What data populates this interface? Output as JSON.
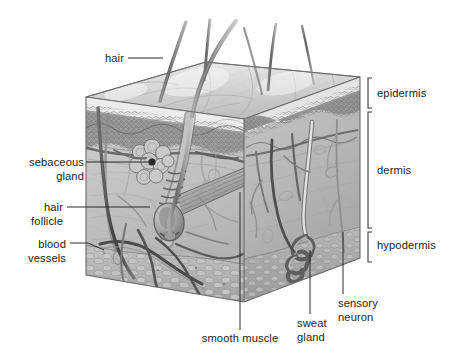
{
  "figure": {
    "kind": "anatomical-diagram",
    "style": "grayscale pencil/airbrush medical illustration",
    "background_color": "#ffffff",
    "ink_color": "#1e1e1e"
  },
  "labels": {
    "hair": "hair",
    "sebaceous_gland": "sebaceous\ngland",
    "hair_follicle": "hair\nfollicle",
    "blood_vessels": "blood\nvessels",
    "smooth_muscle": "smooth muscle",
    "sweat_gland": "sweat\ngland",
    "sensory_neuron": "sensory\nneuron",
    "epidermis": "epidermis",
    "dermis": "dermis",
    "hypodermis": "hypodermis"
  },
  "layers": [
    {
      "name": "epidermis",
      "label": "epidermis",
      "bracket_top": 78,
      "bracket_bottom": 108,
      "text_y": 88
    },
    {
      "name": "dermis",
      "label": "dermis",
      "bracket_top": 110,
      "bracket_bottom": 228,
      "text_y": 165
    },
    {
      "name": "hypodermis",
      "label": "hypodermis",
      "bracket_top": 230,
      "bracket_bottom": 262,
      "text_y": 240
    }
  ],
  "structures": [
    {
      "name": "hair",
      "label": "hair",
      "leader_from": [
        128,
        58
      ],
      "leader_to": [
        163,
        58
      ]
    },
    {
      "name": "sebaceous-gland",
      "label": "sebaceous gland",
      "leader_from": [
        86,
        162
      ],
      "leader_to": [
        152,
        162
      ]
    },
    {
      "name": "hair-follicle",
      "label": "hair follicle",
      "leader_from": [
        67,
        207
      ],
      "leader_to": [
        150,
        207
      ]
    },
    {
      "name": "blood-vessels",
      "label": "blood vessels",
      "leader_from": [
        70,
        243
      ],
      "leader_to": [
        100,
        248
      ]
    },
    {
      "name": "smooth-muscle",
      "label": "smooth muscle",
      "leader_from": [
        240,
        192
      ],
      "leader_to": [
        240,
        330
      ]
    },
    {
      "name": "sweat-gland",
      "label": "sweat gland",
      "leader_from": [
        310,
        250
      ],
      "leader_to": [
        310,
        314
      ]
    },
    {
      "name": "sensory-neuron",
      "label": "sensory neuron",
      "leader_from": [
        343,
        232
      ],
      "leader_to": [
        343,
        294
      ]
    }
  ],
  "palette": {
    "epidermis_band": "#9a9a9a",
    "dermis_fill": "#bdbdbd",
    "hypodermis_fill": "#b2b2b2",
    "top_surface": "#d8d8d8",
    "outline": "#4a4a4a",
    "vessel_dark": "#4e4e4e",
    "label_text": "#1e1e1e"
  }
}
